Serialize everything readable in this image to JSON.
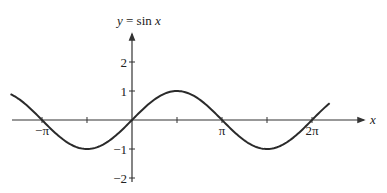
{
  "chart_data": {
    "type": "line",
    "title": "y = sin x",
    "title_parts": {
      "y": "y",
      "eq": " = sin ",
      "x": "x"
    },
    "xlabel": "x",
    "ylabel": "",
    "function": "sin(x)",
    "x_range": [
      -4.24,
      6.9
    ],
    "xlim": [
      -4.5,
      7.5
    ],
    "ylim": [
      -2,
      2.5
    ],
    "x_ticks": [
      {
        "value": -3.14159,
        "label": "−π"
      },
      {
        "value": -1.5708,
        "label": ""
      },
      {
        "value": 1.5708,
        "label": ""
      },
      {
        "value": 3.14159,
        "label": "π"
      },
      {
        "value": 4.7124,
        "label": ""
      },
      {
        "value": 6.28319,
        "label": "2π"
      }
    ],
    "y_ticks": [
      {
        "value": 2,
        "label": "2"
      },
      {
        "value": 1,
        "label": "1"
      },
      {
        "value": -1,
        "label": "−1"
      },
      {
        "value": -2,
        "label": "−2"
      }
    ],
    "x": [
      -4.24,
      -3.14159,
      -1.5708,
      0,
      1.5708,
      3.14159,
      4.7124,
      6.28319,
      6.9
    ],
    "values": [
      0.89,
      0,
      -1,
      0,
      1,
      0,
      -1,
      0,
      0.58
    ],
    "grid": false,
    "legend": null,
    "line_color": "#2a2a2a",
    "axis_color": "#333333"
  }
}
